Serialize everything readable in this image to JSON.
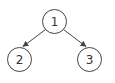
{
  "diagram": {
    "type": "tree",
    "colors": {
      "stroke": "#444444",
      "text": "#333333",
      "background": "#ffffff"
    },
    "nodes": [
      {
        "id": "1",
        "label": "1",
        "cx": 54.5,
        "cy": 21.5,
        "r": 12
      },
      {
        "id": "2",
        "label": "2",
        "cx": 19.5,
        "cy": 59.5,
        "r": 12
      },
      {
        "id": "3",
        "label": "3",
        "cx": 89.5,
        "cy": 59.5,
        "r": 12
      }
    ],
    "edges": [
      {
        "from": "1",
        "to": "2"
      },
      {
        "from": "1",
        "to": "3"
      }
    ]
  }
}
